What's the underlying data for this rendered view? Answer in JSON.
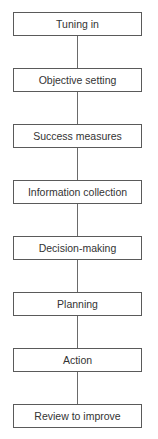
{
  "diagram": {
    "type": "vertical-flowchart",
    "steps": [
      {
        "label": "Tuning in"
      },
      {
        "label": "Objective setting"
      },
      {
        "label": "Success measures"
      },
      {
        "label": "Information collection"
      },
      {
        "label": "Decision-making"
      },
      {
        "label": "Planning"
      },
      {
        "label": "Action"
      },
      {
        "label": "Review to improve"
      }
    ],
    "colors": {
      "border": "#5a5a5a",
      "text": "#333333",
      "background": "#ffffff"
    }
  }
}
